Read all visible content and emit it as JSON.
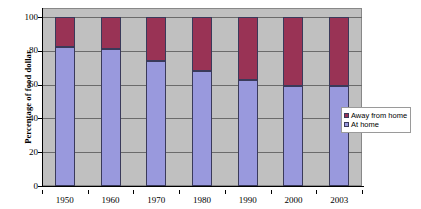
{
  "chart_data": {
    "type": "bar",
    "subtype": "stacked-100-percent",
    "title": "",
    "xlabel": "",
    "ylabel": "Percentage of food dollar",
    "ylim": [
      0,
      100
    ],
    "yticks": [
      0,
      20,
      40,
      60,
      80,
      100
    ],
    "ytick_labels": [
      "0",
      "20",
      "40",
      "60",
      "80",
      "100"
    ],
    "grid": true,
    "grid_axis": "y",
    "legend_position": "right",
    "categories": [
      "1950",
      "1960",
      "1970",
      "1980",
      "1990",
      "2000",
      "2003"
    ],
    "series": [
      {
        "name": "Away from home",
        "color": "#993355",
        "values": [
          18,
          19,
          26,
          32,
          37,
          41,
          41
        ]
      },
      {
        "name": "At home",
        "color": "#9999dd",
        "values": [
          82,
          81,
          74,
          68,
          63,
          59,
          59
        ]
      }
    ],
    "plot_background": "#c0c0c0",
    "figure_background": "#ffffff"
  },
  "legend": {
    "items": [
      {
        "label": "Away from home",
        "color": "#993355"
      },
      {
        "label": "At home",
        "color": "#9999dd"
      }
    ]
  }
}
